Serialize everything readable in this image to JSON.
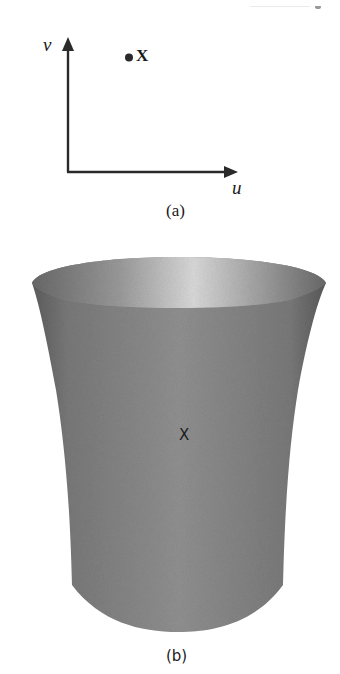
{
  "figure_a": {
    "caption": "(a)",
    "axes": {
      "vertical_label": "v",
      "horizontal_label": "u",
      "stroke_color": "#2a2a2a"
    },
    "point": {
      "label": "X",
      "marker": "filled-dot"
    }
  },
  "figure_b": {
    "caption": "(b)",
    "surface": {
      "shape": "flared-cylinder",
      "point_label": "X",
      "colors": {
        "body": "#8a8a8a",
        "body_edge": "#5e5e5e",
        "rim_highlight": "#dcdcdc",
        "rim_edge": "#7a7a7a"
      }
    }
  }
}
